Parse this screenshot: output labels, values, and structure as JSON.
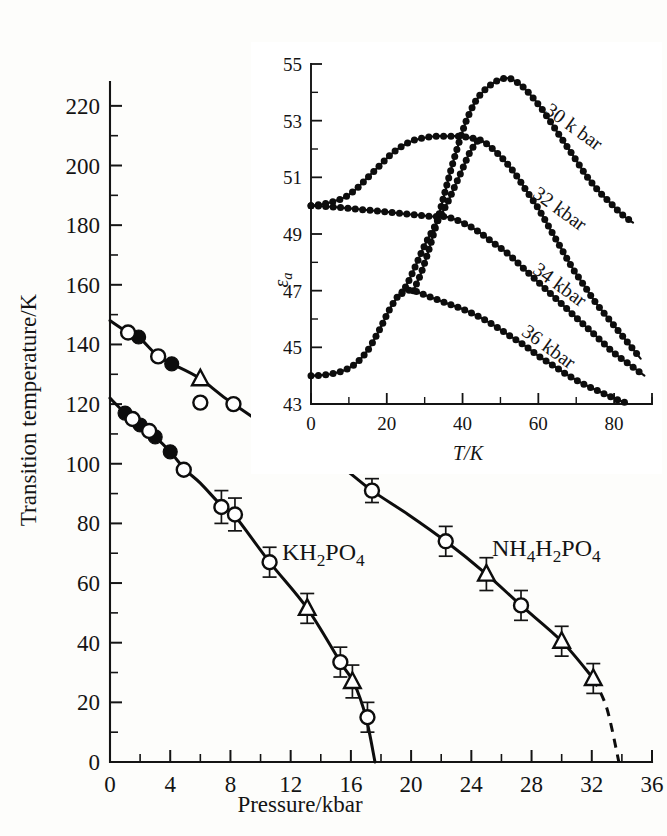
{
  "chart_data": [
    {
      "id": "main",
      "type": "line",
      "title": "",
      "xlabel": "Pressure/kbar",
      "ylabel": "Transition temperature/K",
      "xlim": [
        0,
        36
      ],
      "ylim": [
        0,
        228
      ],
      "xticks": [
        0,
        4,
        8,
        12,
        16,
        20,
        24,
        28,
        32,
        36
      ],
      "xticklabels": [
        "0",
        "4",
        "8",
        "12",
        "16",
        "20",
        "24",
        "28",
        "32",
        "36"
      ],
      "xminor_step": 2,
      "yticks": [
        0,
        20,
        40,
        60,
        80,
        100,
        120,
        140,
        160,
        180,
        200,
        220
      ],
      "yticklabels": [
        "0",
        "20",
        "40",
        "60",
        "80",
        "100",
        "120",
        "140",
        "160",
        "180",
        "200",
        "220"
      ],
      "yminor_step": 10,
      "grid": false,
      "legend": "inline-annotations",
      "series": [
        {
          "name": "KH2PO4",
          "label": "KH₂PO₄",
          "label_text": "KH2PO4",
          "line_kind": "solid",
          "curve": [
            [
              0.0,
              122.0
            ],
            [
              1.0,
              117.0
            ],
            [
              2.0,
              113.0
            ],
            [
              3.0,
              109.0
            ],
            [
              4.0,
              104.0
            ],
            [
              5.0,
              98.0
            ],
            [
              6.0,
              93.5
            ],
            [
              7.4,
              86.0
            ],
            [
              8.3,
              82.5
            ],
            [
              10.6,
              67.0
            ],
            [
              13.1,
              51.5
            ],
            [
              15.3,
              33.5
            ],
            [
              16.2,
              26.5
            ],
            [
              17.0,
              15.0
            ],
            [
              17.6,
              0.0
            ]
          ],
          "points_filled_circle": [
            [
              1.0,
              117.0
            ],
            [
              2.0,
              113.0
            ],
            [
              3.0,
              109.0
            ],
            [
              4.0,
              104.0
            ]
          ],
          "points_open_circle": [
            [
              1.5,
              115.0
            ],
            [
              2.6,
              111.0
            ],
            [
              4.9,
              98.0
            ],
            [
              7.4,
              85.5
            ],
            [
              8.3,
              83.0
            ],
            [
              10.6,
              67.0
            ],
            [
              15.3,
              33.5
            ],
            [
              17.1,
              15.0
            ]
          ],
          "points_open_triangle": [
            [
              13.1,
              51.5
            ],
            [
              16.1,
              27.0
            ]
          ],
          "errorbars": [
            [
              7.4,
              85.5,
              5.5
            ],
            [
              8.3,
              83.0,
              5.5
            ],
            [
              10.6,
              67.0,
              5.0
            ],
            [
              13.1,
              51.5,
              5.0
            ],
            [
              15.3,
              33.5,
              5.0
            ],
            [
              16.1,
              27.0,
              5.5
            ],
            [
              17.1,
              15.0,
              5.0
            ]
          ]
        },
        {
          "name": "NH4H2PO4",
          "label": "NH₄H₂PO₄",
          "label_text": "NH4H2PO4",
          "line_kind": "solid-with-dashed-tail",
          "curve": [
            [
              0.0,
              148.0
            ],
            [
              1.2,
              144.0
            ],
            [
              1.9,
              142.5
            ],
            [
              3.2,
              136.0
            ],
            [
              4.1,
              133.5
            ],
            [
              6.0,
              128.5
            ],
            [
              8.2,
              120.0
            ],
            [
              13.1,
              104.0
            ],
            [
              15.2,
              99.5
            ],
            [
              17.4,
              91.0
            ],
            [
              19.8,
              83.0
            ],
            [
              22.3,
              74.0
            ],
            [
              25.0,
              63.0
            ],
            [
              27.3,
              52.5
            ],
            [
              30.0,
              40.5
            ],
            [
              32.1,
              28.0
            ],
            [
              33.0,
              18.0
            ],
            [
              33.8,
              0.0
            ]
          ],
          "dashed_from": [
            32.1,
            28.0
          ],
          "points_filled_circle": [
            [
              1.9,
              142.5
            ],
            [
              4.1,
              133.5
            ]
          ],
          "points_open_circle": [
            [
              1.2,
              144.0
            ],
            [
              3.2,
              136.0
            ],
            [
              6.0,
              120.5
            ],
            [
              8.2,
              120.0
            ],
            [
              13.1,
              104.0
            ],
            [
              17.4,
              91.0
            ],
            [
              22.3,
              74.0
            ],
            [
              27.3,
              52.5
            ]
          ],
          "points_open_triangle": [
            [
              6.0,
              128.5
            ],
            [
              15.2,
              99.5
            ],
            [
              25.0,
              63.0
            ],
            [
              30.0,
              40.5
            ],
            [
              32.1,
              28.0
            ]
          ],
          "errorbars": [
            [
              17.4,
              91.0,
              4.0
            ],
            [
              22.3,
              74.0,
              5.0
            ],
            [
              25.0,
              63.0,
              5.5
            ],
            [
              27.3,
              52.5,
              5.0
            ],
            [
              30.0,
              40.5,
              5.0
            ],
            [
              32.1,
              28.0,
              5.0
            ]
          ]
        }
      ]
    },
    {
      "id": "inset",
      "type": "line",
      "title": "",
      "xlabel": "T/K",
      "ylabel": "εa",
      "ylabel_base": "ε",
      "ylabel_sub": "a",
      "xlim": [
        0,
        90
      ],
      "ylim": [
        43,
        55
      ],
      "xticks": [
        0,
        20,
        40,
        60,
        80
      ],
      "xticklabels": [
        "0",
        "20",
        "40",
        "60",
        "80"
      ],
      "xminor_step": 10,
      "yticks": [
        43,
        45,
        47,
        49,
        51,
        53,
        55
      ],
      "yticklabels": [
        "43",
        "45",
        "47",
        "49",
        "51",
        "53",
        "55"
      ],
      "yminor_step": 1,
      "grid": false,
      "legend": "inline-rotated-labels",
      "series": [
        {
          "name": "30 kbar",
          "label": "30 k bar",
          "peak": [
            52.0,
            54.5
          ],
          "values": [
            [
              27.0,
              47.0
            ],
            [
              29.0,
              47.6
            ],
            [
              31.0,
              48.4
            ],
            [
              33.0,
              49.3
            ],
            [
              35.0,
              50.3
            ],
            [
              37.0,
              51.3
            ],
            [
              39.0,
              52.2
            ],
            [
              41.0,
              53.0
            ],
            [
              43.5,
              53.7
            ],
            [
              46.0,
              54.1
            ],
            [
              49.0,
              54.4
            ],
            [
              52.0,
              54.5
            ],
            [
              55.0,
              54.3
            ],
            [
              58.0,
              53.9
            ],
            [
              61.0,
              53.4
            ],
            [
              64.0,
              52.8
            ],
            [
              67.0,
              52.2
            ],
            [
              70.0,
              51.6
            ],
            [
              73.0,
              51.0
            ],
            [
              76.0,
              50.5
            ],
            [
              79.0,
              50.1
            ],
            [
              82.0,
              49.7
            ],
            [
              85.0,
              49.4
            ]
          ]
        },
        {
          "name": "32 kbar",
          "label": "32 kbar",
          "peak": [
            42.0,
            52.4
          ],
          "values": [
            [
              0.0,
              50.0
            ],
            [
              3.0,
              50.05
            ],
            [
              6.0,
              50.15
            ],
            [
              9.0,
              50.3
            ],
            [
              12.0,
              50.6
            ],
            [
              15.0,
              51.0
            ],
            [
              18.0,
              51.4
            ],
            [
              21.0,
              51.8
            ],
            [
              24.0,
              52.1
            ],
            [
              27.0,
              52.3
            ],
            [
              30.0,
              52.4
            ],
            [
              33.0,
              52.45
            ],
            [
              36.0,
              52.45
            ],
            [
              39.0,
              52.45
            ],
            [
              42.0,
              52.4
            ],
            [
              45.0,
              52.3
            ],
            [
              48.0,
              52.0
            ],
            [
              51.0,
              51.6
            ],
            [
              54.0,
              51.1
            ],
            [
              57.0,
              50.5
            ],
            [
              60.0,
              49.9
            ],
            [
              63.0,
              49.2
            ],
            [
              66.0,
              48.5
            ],
            [
              69.0,
              47.8
            ],
            [
              72.0,
              47.2
            ],
            [
              75.0,
              46.6
            ],
            [
              78.0,
              46.1
            ],
            [
              81.0,
              45.6
            ],
            [
              84.0,
              45.1
            ],
            [
              87.0,
              44.6
            ]
          ]
        },
        {
          "name": "34 kbar",
          "label": "34 kbar",
          "peak": [
            36.0,
            49.6
          ],
          "values": [
            [
              0.0,
              50.0
            ],
            [
              4.0,
              49.97
            ],
            [
              8.0,
              49.93
            ],
            [
              12.0,
              49.88
            ],
            [
              16.0,
              49.83
            ],
            [
              20.0,
              49.78
            ],
            [
              24.0,
              49.72
            ],
            [
              28.0,
              49.67
            ],
            [
              32.0,
              49.62
            ],
            [
              36.0,
              49.6
            ],
            [
              40.0,
              49.4
            ],
            [
              44.0,
              49.1
            ],
            [
              48.0,
              48.7
            ],
            [
              52.0,
              48.3
            ],
            [
              56.0,
              47.8
            ],
            [
              60.0,
              47.3
            ],
            [
              64.0,
              46.8
            ],
            [
              68.0,
              46.3
            ],
            [
              72.0,
              45.8
            ],
            [
              76.0,
              45.3
            ],
            [
              80.0,
              44.8
            ],
            [
              84.0,
              44.4
            ],
            [
              88.0,
              44.0
            ]
          ]
        },
        {
          "name": "36 kbar",
          "label": "36 kbar",
          "peak": [
            24.0,
            47.0
          ],
          "values": [
            [
              0.0,
              44.0
            ],
            [
              3.0,
              44.02
            ],
            [
              6.0,
              44.08
            ],
            [
              9.0,
              44.2
            ],
            [
              12.0,
              44.45
            ],
            [
              15.0,
              44.9
            ],
            [
              18.0,
              45.6
            ],
            [
              21.0,
              46.4
            ],
            [
              24.0,
              46.95
            ],
            [
              27.0,
              47.0
            ],
            [
              30.0,
              46.85
            ],
            [
              33.0,
              46.7
            ],
            [
              36.0,
              46.55
            ],
            [
              40.0,
              46.35
            ],
            [
              44.0,
              46.1
            ],
            [
              48.0,
              45.8
            ],
            [
              52.0,
              45.45
            ],
            [
              56.0,
              45.1
            ],
            [
              60.0,
              44.7
            ],
            [
              64.0,
              44.35
            ],
            [
              68.0,
              44.0
            ],
            [
              72.0,
              43.7
            ],
            [
              76.0,
              43.45
            ],
            [
              80.0,
              43.2
            ],
            [
              83.0,
              43.05
            ]
          ]
        },
        {
          "name": "36 kbar rising branch",
          "label": "",
          "values": [
            [
              24.0,
              46.9
            ],
            [
              26.0,
              47.4
            ],
            [
              28.0,
              48.0
            ],
            [
              30.0,
              48.6
            ],
            [
              32.0,
              49.1
            ],
            [
              34.0,
              49.6
            ],
            [
              36.0,
              50.1
            ],
            [
              38.0,
              50.7
            ],
            [
              40.0,
              51.3
            ],
            [
              42.0,
              51.9
            ],
            [
              44.0,
              52.3
            ]
          ]
        }
      ]
    }
  ],
  "figure": {
    "main_axis": {
      "x_title": "Pressure/kbar",
      "y_title": "Transition temperature/K"
    },
    "inset_axis": {
      "x_title": "T/K",
      "y_title_base": "ε",
      "y_title_sub": "a"
    },
    "annotations": {
      "series_kdp_main": "KH",
      "series_kdp_sub1": "2",
      "series_kdp_mid": "PO",
      "series_kdp_sub2": "4",
      "series_adp_main": "NH",
      "series_adp_sub0": "4",
      "series_adp_mid1": "H",
      "series_adp_sub1": "2",
      "series_adp_mid2": "PO",
      "series_adp_sub2": "4",
      "inset_label_30": "30 k bar",
      "inset_label_32": "32 kbar",
      "inset_label_34": "34 kbar",
      "inset_label_36": "36 kbar"
    },
    "ticklabels": {
      "main_x": [
        "0",
        "4",
        "8",
        "12",
        "16",
        "20",
        "24",
        "28",
        "32",
        "36"
      ],
      "main_y": [
        "0",
        "20",
        "40",
        "60",
        "80",
        "100",
        "120",
        "140",
        "160",
        "180",
        "200",
        "220"
      ],
      "inset_x": [
        "0",
        "20",
        "40",
        "60",
        "80"
      ],
      "inset_y": [
        "43",
        "45",
        "47",
        "49",
        "51",
        "53",
        "55"
      ]
    },
    "colors": {
      "ink": "#111111",
      "paper": "#fdfdfb",
      "marker_fill_open": "#ffffff"
    }
  }
}
